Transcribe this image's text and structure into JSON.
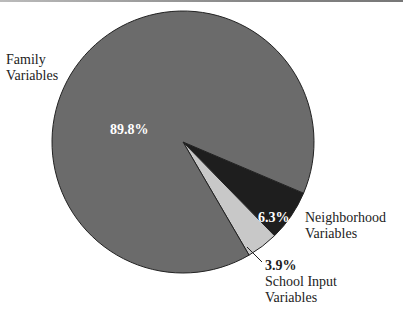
{
  "chart_data": {
    "type": "pie",
    "title": "",
    "categories": [
      "Family Variables",
      "Neighborhood Variables",
      "School Input Variables"
    ],
    "values": [
      89.8,
      6.3,
      3.9
    ],
    "value_labels": [
      "89.8%",
      "6.3%",
      "3.9%"
    ],
    "colors": [
      "#6b6b6b",
      "#1e1e1e",
      "#c8c8c8"
    ],
    "legend": "none (direct labels)"
  },
  "labels": {
    "family_line1": "Family",
    "family_line2": "Variables",
    "family_pct": "89.8%",
    "neighborhood_line1": "Neighborhood",
    "neighborhood_line2": "Variables",
    "neighborhood_pct": "6.3%",
    "school_pct": "3.9%",
    "school_line1": "School Input",
    "school_line2": "Variables"
  }
}
